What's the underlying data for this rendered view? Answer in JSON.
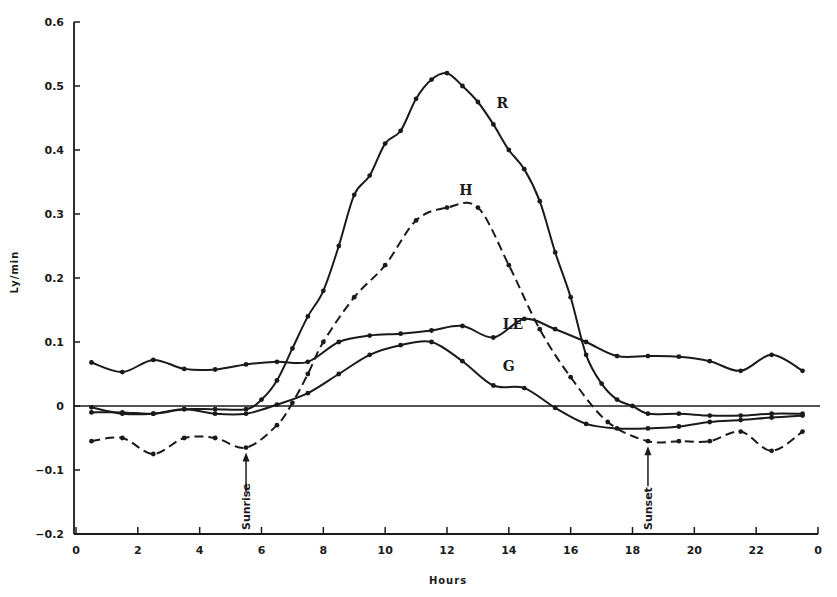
{
  "chart_data": {
    "type": "line",
    "title": "",
    "xlabel": "Hours",
    "ylabel": "Ly/min",
    "xlim": [
      0,
      24
    ],
    "ylim": [
      -0.2,
      0.6
    ],
    "grid": false,
    "legend": "inline labels",
    "x_ticks": [
      {
        "value": 0,
        "label": "0"
      },
      {
        "value": 2,
        "label": "2"
      },
      {
        "value": 4,
        "label": "4"
      },
      {
        "value": 6,
        "label": "6"
      },
      {
        "value": 8,
        "label": "8"
      },
      {
        "value": 10,
        "label": "10"
      },
      {
        "value": 12,
        "label": "12"
      },
      {
        "value": 14,
        "label": "14"
      },
      {
        "value": 16,
        "label": "16"
      },
      {
        "value": 18,
        "label": "18"
      },
      {
        "value": 20,
        "label": "20"
      },
      {
        "value": 22,
        "label": "22"
      },
      {
        "value": 24,
        "label": "0"
      }
    ],
    "y_ticks": [
      {
        "value": 0.6,
        "label": "0.6"
      },
      {
        "value": 0.5,
        "label": "0.5"
      },
      {
        "value": 0.4,
        "label": "0.4"
      },
      {
        "value": 0.3,
        "label": "0.3"
      },
      {
        "value": 0.2,
        "label": "0.2"
      },
      {
        "value": 0.1,
        "label": "0.1"
      },
      {
        "value": 0,
        "label": "0"
      },
      {
        "value": -0.1,
        "label": "−0.1"
      },
      {
        "value": -0.2,
        "label": "−0.2"
      }
    ],
    "series": [
      {
        "name": "R",
        "style": "solid",
        "label_pos": [
          13.6,
          0.465
        ],
        "points": [
          [
            0.5,
            -0.01
          ],
          [
            1.5,
            -0.01
          ],
          [
            2.5,
            -0.012
          ],
          [
            3.5,
            -0.005
          ],
          [
            4.5,
            -0.005
          ],
          [
            5.5,
            -0.005
          ],
          [
            6,
            0.01
          ],
          [
            6.5,
            0.04
          ],
          [
            7,
            0.09
          ],
          [
            7.5,
            0.14
          ],
          [
            8,
            0.18
          ],
          [
            8.5,
            0.25
          ],
          [
            9,
            0.33
          ],
          [
            9.5,
            0.36
          ],
          [
            10,
            0.41
          ],
          [
            10.5,
            0.43
          ],
          [
            11,
            0.48
          ],
          [
            11.5,
            0.51
          ],
          [
            12,
            0.52
          ],
          [
            12.5,
            0.5
          ],
          [
            13,
            0.475
          ],
          [
            13.5,
            0.44
          ],
          [
            14,
            0.4
          ],
          [
            14.5,
            0.37
          ],
          [
            15,
            0.32
          ],
          [
            15.5,
            0.24
          ],
          [
            16,
            0.17
          ],
          [
            16.5,
            0.08
          ],
          [
            17,
            0.035
          ],
          [
            17.5,
            0.01
          ],
          [
            18,
            0
          ],
          [
            18.5,
            -0.012
          ],
          [
            19.5,
            -0.012
          ],
          [
            20.5,
            -0.015
          ],
          [
            21.5,
            -0.015
          ],
          [
            22.5,
            -0.012
          ],
          [
            23.5,
            -0.012
          ]
        ]
      },
      {
        "name": "H",
        "style": "dashed",
        "label_pos": [
          12.4,
          0.33
        ],
        "points": [
          [
            0.5,
            -0.055
          ],
          [
            1.5,
            -0.05
          ],
          [
            2.5,
            -0.075
          ],
          [
            3.5,
            -0.05
          ],
          [
            4.5,
            -0.05
          ],
          [
            5.5,
            -0.065
          ],
          [
            6.5,
            -0.03
          ],
          [
            7,
            0.005
          ],
          [
            7.5,
            0.05
          ],
          [
            8,
            0.1
          ],
          [
            9,
            0.17
          ],
          [
            10,
            0.22
          ],
          [
            11,
            0.29
          ],
          [
            12,
            0.31
          ],
          [
            13,
            0.31
          ],
          [
            14,
            0.22
          ],
          [
            15,
            0.12
          ],
          [
            16,
            0.045
          ],
          [
            17.2,
            -0.025
          ],
          [
            18.5,
            -0.055
          ],
          [
            19.5,
            -0.055
          ],
          [
            20.5,
            -0.055
          ],
          [
            21.5,
            -0.04
          ],
          [
            22.5,
            -0.07
          ],
          [
            23.5,
            -0.04
          ]
        ]
      },
      {
        "name": "LE",
        "style": "solid",
        "label_pos": [
          13.8,
          0.12
        ],
        "points": [
          [
            0.5,
            0.068
          ],
          [
            1.5,
            0.053
          ],
          [
            2.5,
            0.072
          ],
          [
            3.5,
            0.058
          ],
          [
            4.5,
            0.057
          ],
          [
            5.5,
            0.065
          ],
          [
            6.5,
            0.069
          ],
          [
            7.5,
            0.069
          ],
          [
            8.5,
            0.1
          ],
          [
            9.5,
            0.11
          ],
          [
            10.5,
            0.113
          ],
          [
            11.5,
            0.118
          ],
          [
            12.5,
            0.125
          ],
          [
            13.5,
            0.107
          ],
          [
            14.5,
            0.136
          ],
          [
            15.5,
            0.12
          ],
          [
            16.5,
            0.1
          ],
          [
            17.5,
            0.078
          ],
          [
            18.5,
            0.078
          ],
          [
            19.5,
            0.077
          ],
          [
            20.5,
            0.07
          ],
          [
            21.5,
            0.055
          ],
          [
            22.5,
            0.08
          ],
          [
            23.5,
            0.055
          ]
        ]
      },
      {
        "name": "G",
        "style": "solid",
        "label_pos": [
          13.8,
          0.055
        ],
        "points": [
          [
            0.5,
            -0.002
          ],
          [
            1.5,
            -0.012
          ],
          [
            2.5,
            -0.012
          ],
          [
            3.5,
            -0.005
          ],
          [
            4.5,
            -0.012
          ],
          [
            5.5,
            -0.012
          ],
          [
            6.5,
            0.002
          ],
          [
            7.5,
            0.02
          ],
          [
            8.5,
            0.05
          ],
          [
            9.5,
            0.08
          ],
          [
            10.5,
            0.095
          ],
          [
            11.5,
            0.1
          ],
          [
            12.5,
            0.07
          ],
          [
            13.5,
            0.032
          ],
          [
            14.5,
            0.028
          ],
          [
            15.5,
            -0.003
          ],
          [
            16.5,
            -0.028
          ],
          [
            17.5,
            -0.035
          ],
          [
            18.5,
            -0.035
          ],
          [
            19.5,
            -0.032
          ],
          [
            20.5,
            -0.025
          ],
          [
            21.5,
            -0.022
          ],
          [
            22.5,
            -0.018
          ],
          [
            23.5,
            -0.015
          ]
        ]
      }
    ],
    "annotations": [
      {
        "text": "Sunrise",
        "x": 5.5,
        "arrow_to_y": -0.065,
        "orientation": "vertical"
      },
      {
        "text": "Sunset",
        "x": 18.5,
        "arrow_to_y": -0.055,
        "orientation": "vertical"
      }
    ],
    "reference_lines": [
      {
        "y": 0,
        "style": "solid"
      }
    ]
  }
}
